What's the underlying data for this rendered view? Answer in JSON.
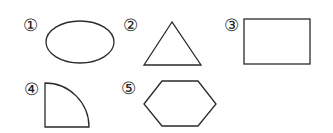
{
  "figure": {
    "stroke_color": "#2a2a2a",
    "background": "#ffffff",
    "items": [
      {
        "label": "①",
        "shape": "ellipse"
      },
      {
        "label": "②",
        "shape": "triangle"
      },
      {
        "label": "③",
        "shape": "rectangle"
      },
      {
        "label": "④",
        "shape": "quarter-circle"
      },
      {
        "label": "⑤",
        "shape": "hexagon"
      }
    ]
  }
}
